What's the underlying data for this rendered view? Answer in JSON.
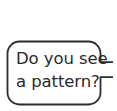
{
  "canvas": {
    "width": 117,
    "height": 111,
    "background_color": "#ffffff"
  },
  "speech_bubble": {
    "shape": "rounded-rectangle-with-right-tail",
    "stroke_color": "#2b2b2b",
    "stroke_width": 1.8,
    "fill_color": "#ffffff",
    "corner_radius": 12,
    "bounds": {
      "x": 7,
      "y": 41,
      "width": 94,
      "height": 63
    },
    "tail": {
      "name": "speech-bubble-tail",
      "side": "right",
      "direction": "points-right-offscreen",
      "top_y": 62,
      "bottom_y": 77
    },
    "text": {
      "color": "#2b2b2b",
      "lines": [
        "Do you see",
        "a pattern?"
      ],
      "full_text": "Do you see a pattern?"
    }
  }
}
